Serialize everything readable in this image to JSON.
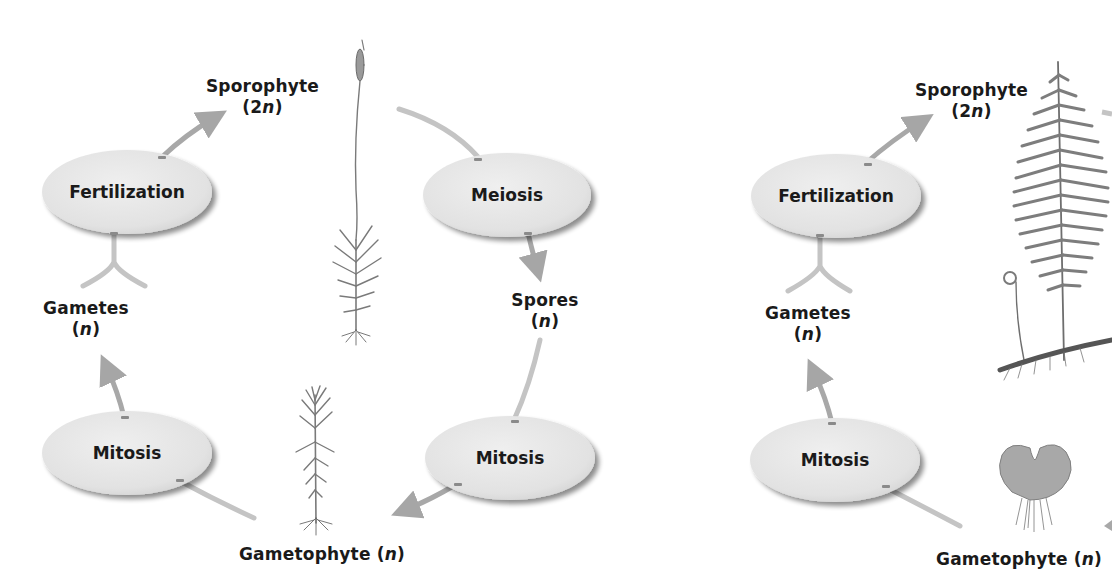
{
  "diagrams": [
    {
      "name": "moss-life-cycle",
      "nodes": {
        "fertilization": "Fertilization",
        "meiosis": "Meiosis",
        "mitosis_left": "Mitosis",
        "mitosis_right": "Mitosis"
      },
      "labels": {
        "sporophyte": "Sporophyte",
        "sporophyte_ploidy_num": "2",
        "sporophyte_ploidy_var": "n",
        "spores": "Spores",
        "spores_ploidy_var": "n",
        "gametes": "Gametes",
        "gametes_ploidy_var": "n",
        "gametophyte": "Gametophyte",
        "gametophyte_ploidy_var": "n"
      },
      "illustrations": [
        "moss-sporophyte-illustration",
        "moss-gametophyte-illustration"
      ]
    },
    {
      "name": "fern-life-cycle",
      "nodes": {
        "fertilization": "Fertilization",
        "mitosis": "Mitosis"
      },
      "labels": {
        "sporophyte": "Sporophyte",
        "sporophyte_ploidy_num": "2",
        "sporophyte_ploidy_var": "n",
        "gametes": "Gametes",
        "gametes_ploidy_var": "n",
        "gametophyte": "Gametophyte",
        "gametophyte_ploidy_var": "n"
      },
      "illustrations": [
        "fern-sporophyte-illustration",
        "fern-gametophyte-prothallus-illustration"
      ]
    }
  ],
  "colors": {
    "ellipse_fill": "#e6e6e6",
    "ellipse_shadow": "#9a9a9a",
    "arrow": "#a8a8a8",
    "arrow_light": "#c4c4c4",
    "text": "#1a1a1a",
    "plant": "#7a7a7a"
  }
}
